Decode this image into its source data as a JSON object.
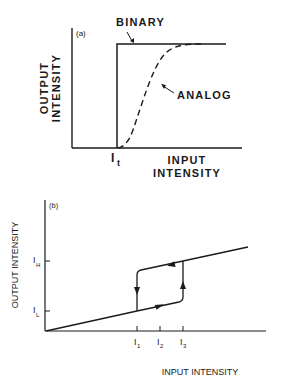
{
  "panel_a": {
    "tag": "(a)",
    "y_label_line1": "OUTPUT",
    "y_label_line2": "INTENSITY",
    "x_label_line1": "INPUT",
    "x_label_line2": "INTENSITY",
    "threshold_label": "I",
    "threshold_sub": "t",
    "curve_binary_label": "BINARY",
    "curve_analog_label": "ANALOG"
  },
  "panel_b": {
    "tag": "(b)",
    "y_label": "OUTPUT INTENSITY",
    "x_label": "INPUT INTENSITY",
    "y_ticks": [
      {
        "label": "I",
        "sub": "H"
      },
      {
        "label": "I",
        "sub": "L"
      }
    ],
    "x_ticks": [
      {
        "label": "I",
        "sub": "1"
      },
      {
        "label": "I",
        "sub": "2"
      },
      {
        "label": "I",
        "sub": "3"
      }
    ]
  },
  "colors": {
    "ink": "#1a1a1a",
    "background": "#ffffff"
  }
}
